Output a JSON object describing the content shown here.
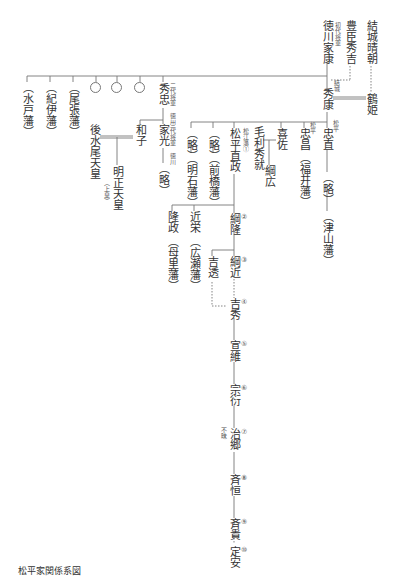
{
  "title": "松平家関係系図",
  "people": {
    "yuki_harutomo": "結城晴朝",
    "toyotomi": "豊臣秀吉",
    "ieyasu": "徳川家康",
    "ieyasu_note": "初代将軍",
    "hideyasu": "秀康",
    "hideyasu_note": "結城",
    "tsuruhime": "鶴姫",
    "mito": "（水戸藩）",
    "kii": "（紀伊藩）",
    "owari": "（尾張藩）",
    "hidetada": "秀忠",
    "hidetada_note": "二代将軍 徳川",
    "iemitsu": "家光",
    "iemitsu_note": "三代将軍 徳川",
    "iemitsu_child": "（略）",
    "kazuko": "和子",
    "gomizunoo": "後水尾天皇",
    "meisho": "明正天皇",
    "meisho_note": "（上皇）",
    "ryaku_akashi": "（略）",
    "akashi": "（明石藩）",
    "ryaku_maebashi": "（略）",
    "maebashi": "（前橋藩）",
    "naomasa": "松平直政",
    "naomasa_note": "松江藩①",
    "mori": "毛利秀就",
    "tsunahiro": "綱広",
    "kisa": "喜佐",
    "tadamasa": "忠昌",
    "tadamasa_note": "松平",
    "fukui": "（福井藩）",
    "tadanao": "忠直",
    "tadanao_note": "松平",
    "tadanao_child": "（略）",
    "tsuyama": "（津山藩）",
    "takamasa": "隆政",
    "bokuro": "（母里藩）",
    "chikayoshi": "近栄",
    "hirose": "（広瀬藩）",
    "tsunataka": "綱隆",
    "yoshitoo": "吉透",
    "tsunachika": "綱近",
    "yoshito": "吉透",
    "yoshihide": "吉秀",
    "nobuzumi": "宣維",
    "munenobu": "宗衍",
    "harusato": "治郷",
    "harusato_note": "不昧",
    "naritsune": "斉恒",
    "naritaka": "斉貴",
    "sadayasu": "定安"
  },
  "generation_numbers": [
    "①",
    "②",
    "③",
    "④",
    "⑤",
    "⑥",
    "⑦",
    "⑧",
    "⑨",
    "⑩"
  ]
}
